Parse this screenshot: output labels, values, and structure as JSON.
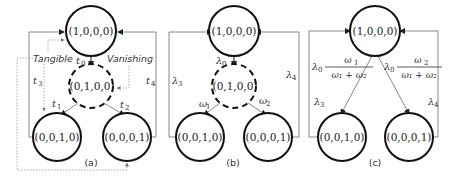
{
  "figure": {
    "panels": [
      {
        "id": "a",
        "caption": "(a)",
        "nodes": [
          {
            "label": "(1,0,0,0)",
            "style": "solid"
          },
          {
            "label": "(0,1,0,0)",
            "style": "dashed"
          },
          {
            "label": "(0,0,1,0)",
            "style": "solid"
          },
          {
            "label": "(0,0,0,1)",
            "style": "solid"
          }
        ],
        "edges": [
          {
            "label": "t",
            "sub": "0"
          },
          {
            "label": "t",
            "sub": "1"
          },
          {
            "label": "t",
            "sub": "2"
          },
          {
            "label": "t",
            "sub": "3"
          },
          {
            "label": "t",
            "sub": "4"
          }
        ],
        "annotations": {
          "tangible": "Tangible",
          "vanishing": "Vanishing"
        }
      },
      {
        "id": "b",
        "caption": "(b)",
        "nodes": [
          {
            "label": "(1,0,0,0)",
            "style": "solid"
          },
          {
            "label": "(0,1,0,0)",
            "style": "dashed"
          },
          {
            "label": "(0,0,1,0)",
            "style": "solid"
          },
          {
            "label": "(0,0,0,1)",
            "style": "solid"
          }
        ],
        "edges": [
          {
            "label": "λ",
            "sub": "0"
          },
          {
            "label": "ω",
            "sub": "1"
          },
          {
            "label": "ω",
            "sub": "2"
          },
          {
            "label": "λ",
            "sub": "3"
          },
          {
            "label": "λ",
            "sub": "4"
          }
        ]
      },
      {
        "id": "c",
        "caption": "(c)",
        "nodes": [
          {
            "label": "(1,0,0,0)",
            "style": "solid"
          },
          {
            "label": "(0,0,1,0)",
            "style": "solid"
          },
          {
            "label": "(0,0,0,1)",
            "style": "solid"
          }
        ],
        "edges": [
          {
            "label": "λ",
            "sub": "0",
            "num": "ω",
            "num_sub": "1",
            "den": "ω₁ + ω₂"
          },
          {
            "label": "λ",
            "sub": "0",
            "num": "ω",
            "num_sub": "2",
            "den": "ω₁ + ω₂"
          },
          {
            "label": "λ",
            "sub": "3"
          },
          {
            "label": "λ",
            "sub": "4"
          }
        ]
      }
    ]
  }
}
